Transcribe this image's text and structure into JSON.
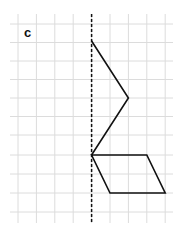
{
  "figure": {
    "label": "c",
    "grid": {
      "cell_size": 18.4,
      "x_lines": [
        18,
        36.4,
        54.8,
        73.2,
        91.6,
        110,
        128.4,
        146.8,
        165.2
      ],
      "y_lines": [
        24,
        42.5,
        61,
        79.5,
        98,
        116.5,
        135,
        155,
        174,
        193,
        212
      ],
      "x_extent": [
        10,
        173
      ],
      "y_extent": [
        14,
        223
      ],
      "color": "#dcdcdc"
    },
    "mirror_line": {
      "x": 91.6,
      "y1": 14,
      "y2": 223,
      "style": "dashed",
      "color": "#111111"
    },
    "shapes": [
      {
        "name": "zigzag-polyline",
        "type": "polyline",
        "points": [
          [
            91.6,
            41
          ],
          [
            128.4,
            98
          ],
          [
            91.6,
            155
          ]
        ]
      },
      {
        "name": "parallelogram",
        "type": "polygon",
        "points": [
          [
            91.6,
            155
          ],
          [
            146.8,
            155
          ],
          [
            165.2,
            193
          ],
          [
            110,
            193
          ]
        ]
      }
    ],
    "stroke_color": "#111111"
  }
}
